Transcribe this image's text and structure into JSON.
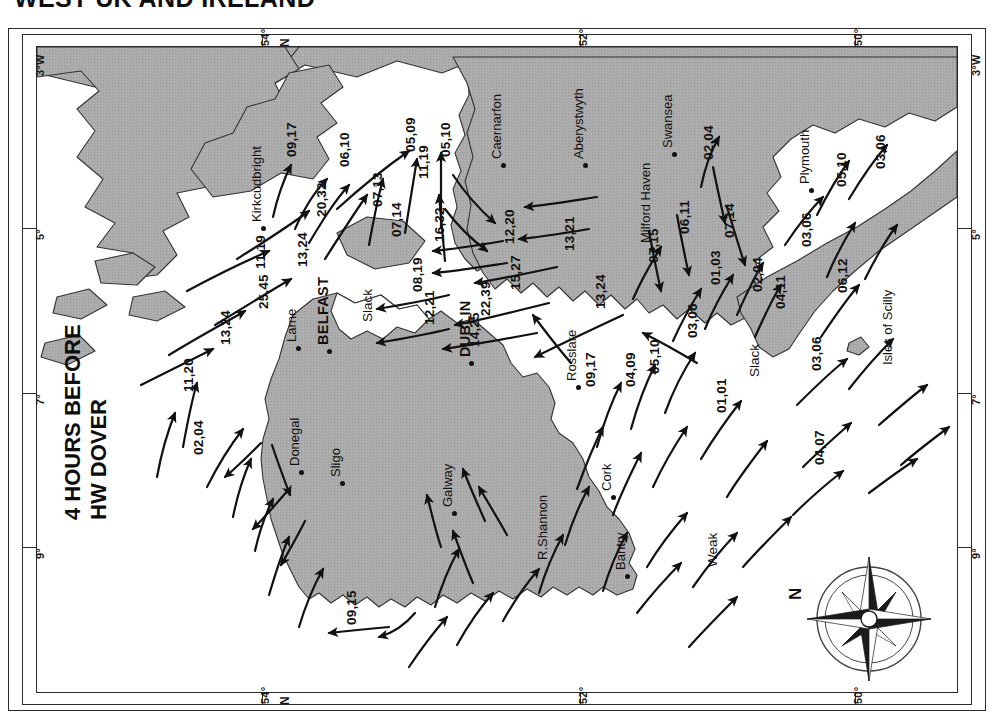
{
  "page": {
    "title": "WEST UK AND IRELAND",
    "caption_line1": "4 HOURS BEFORE",
    "caption_line2": "HW DOVER",
    "compass_north": "N"
  },
  "graticule": {
    "longitude_labels": [
      "3°W",
      "5°",
      "7°",
      "9°"
    ],
    "latitude_labels": [
      "54°",
      "52°",
      "50°"
    ],
    "north_marker": "N"
  },
  "map": {
    "land_color": "#a9a9a9",
    "sea_color": "#ffffff",
    "ink_color": "#111111",
    "places": [
      {
        "name": "Kirkcudbright",
        "x": 212,
        "y": 175,
        "dot": true
      },
      {
        "name": "Larne",
        "x": 247,
        "y": 295,
        "dot": true
      },
      {
        "name": "BELFAST",
        "x": 278,
        "y": 298,
        "dot": true,
        "capital": true
      },
      {
        "name": "Donegal",
        "x": 250,
        "y": 419,
        "dot": true
      },
      {
        "name": "Sligo",
        "x": 291,
        "y": 430,
        "dot": true
      },
      {
        "name": "Galway",
        "x": 403,
        "y": 460,
        "dot": true
      },
      {
        "name": "R.Shannon",
        "x": 498,
        "y": 513,
        "dot": false
      },
      {
        "name": "Bantry",
        "x": 576,
        "y": 523,
        "dot": true
      },
      {
        "name": "Cork",
        "x": 562,
        "y": 444,
        "dot": true
      },
      {
        "name": "Rosslare",
        "x": 527,
        "y": 334,
        "dot": true
      },
      {
        "name": "DUBLIN",
        "x": 420,
        "y": 310,
        "dot": true,
        "capital": true
      },
      {
        "name": "Caernarfon",
        "x": 452,
        "y": 112,
        "dot": true
      },
      {
        "name": "Aberystwyth",
        "x": 534,
        "y": 112,
        "dot": true
      },
      {
        "name": "Milford Haven",
        "x": 601,
        "y": 196,
        "dot": true
      },
      {
        "name": "Swansea",
        "x": 623,
        "y": 101,
        "dot": true
      },
      {
        "name": "Plymouth",
        "x": 760,
        "y": 137,
        "dot": true
      },
      {
        "name": "Isles of Scilly",
        "x": 843,
        "y": 318,
        "dot": false
      }
    ],
    "rates": [
      {
        "v": "09,17",
        "x": 247,
        "y": 110
      },
      {
        "v": "06,10",
        "x": 300,
        "y": 120
      },
      {
        "v": "05,09",
        "x": 366,
        "y": 105
      },
      {
        "v": "05,10",
        "x": 401,
        "y": 110
      },
      {
        "v": "20,32",
        "x": 277,
        "y": 170
      },
      {
        "v": "07,13",
        "x": 333,
        "y": 160
      },
      {
        "v": "11,19",
        "x": 379,
        "y": 132
      },
      {
        "v": "07,14",
        "x": 352,
        "y": 190
      },
      {
        "v": "16,32",
        "x": 395,
        "y": 195
      },
      {
        "v": "11,19",
        "x": 216,
        "y": 222
      },
      {
        "v": "13,24",
        "x": 258,
        "y": 220
      },
      {
        "v": "25,45",
        "x": 219,
        "y": 262
      },
      {
        "v": "13,24",
        "x": 181,
        "y": 298
      },
      {
        "v": "11,20",
        "x": 144,
        "y": 345
      },
      {
        "v": "02,04",
        "x": 154,
        "y": 408
      },
      {
        "v": "08,19",
        "x": 373,
        "y": 245
      },
      {
        "v": "12,21",
        "x": 385,
        "y": 278
      },
      {
        "v": "12,20",
        "x": 465,
        "y": 197
      },
      {
        "v": "13,21",
        "x": 525,
        "y": 204
      },
      {
        "v": "15,27",
        "x": 471,
        "y": 243
      },
      {
        "v": "22,39",
        "x": 441,
        "y": 269
      },
      {
        "v": "14,25",
        "x": 430,
        "y": 300
      },
      {
        "v": "13,24",
        "x": 556,
        "y": 262
      },
      {
        "v": "02,04",
        "x": 664,
        "y": 113
      },
      {
        "v": "06,11",
        "x": 640,
        "y": 187
      },
      {
        "v": "07,14",
        "x": 685,
        "y": 191
      },
      {
        "v": "07,15",
        "x": 609,
        "y": 216
      },
      {
        "v": "01,03",
        "x": 671,
        "y": 238
      },
      {
        "v": "03,06",
        "x": 648,
        "y": 291
      },
      {
        "v": "02,04",
        "x": 713,
        "y": 245
      },
      {
        "v": "04,11",
        "x": 736,
        "y": 262
      },
      {
        "v": "03,06",
        "x": 762,
        "y": 200
      },
      {
        "v": "05,10",
        "x": 797,
        "y": 140
      },
      {
        "v": "03,06",
        "x": 836,
        "y": 122
      },
      {
        "v": "06,12",
        "x": 798,
        "y": 246
      },
      {
        "v": "03,06",
        "x": 772,
        "y": 324
      },
      {
        "v": "01,01",
        "x": 677,
        "y": 366
      },
      {
        "v": "04,07",
        "x": 775,
        "y": 418
      },
      {
        "v": "05,10",
        "x": 610,
        "y": 327
      },
      {
        "v": "04,09",
        "x": 586,
        "y": 340
      },
      {
        "v": "09,17",
        "x": 546,
        "y": 340
      },
      {
        "v": "09,15",
        "x": 307,
        "y": 578
      }
    ],
    "words": [
      {
        "v": "Slack",
        "x": 323,
        "y": 275
      },
      {
        "v": "Slack",
        "x": 710,
        "y": 330
      },
      {
        "v": "Weak",
        "x": 668,
        "y": 520
      }
    ]
  }
}
